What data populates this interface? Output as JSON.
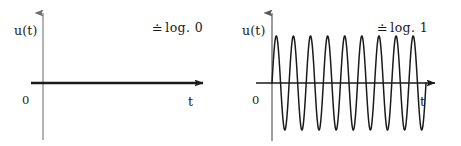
{
  "figure": {
    "background_color": "#ffffff",
    "axis_color_vertical_left": "#9a9a9a",
    "axis_color_vertical_right": "#7d7d7d",
    "axis_color_horizontal": "#1a1a1a",
    "curve_color": "#1a1a1a"
  },
  "panels": [
    {
      "id": "panel-left",
      "y_axis_label": "u(t)",
      "x_axis_label": "t",
      "origin_label": "0",
      "annotation_symbol": "≐",
      "annotation_text": "log. 0"
    },
    {
      "id": "panel-right",
      "y_axis_label": "u(t)",
      "x_axis_label": "t",
      "origin_label": "0",
      "annotation_symbol": "≐",
      "annotation_text": "log. 1"
    }
  ],
  "chart_data": [
    {
      "type": "line",
      "title": "",
      "subtitle": "",
      "annotation": "≐ log. 0",
      "xlabel": "t",
      "ylabel": "u(t)",
      "xlim": [
        0,
        10
      ],
      "ylim": [
        -1.15,
        1.15
      ],
      "grid": false,
      "legend": "none",
      "series": [
        {
          "name": "u(t) = 0",
          "waveform": "constant",
          "amplitude": 0,
          "frequency_cycles": 0,
          "values_description": "flat line at u = 0 for all t > 0",
          "x": [
            0,
            1,
            2,
            3,
            4,
            5,
            6,
            7,
            8,
            9,
            10
          ],
          "values": [
            0,
            0,
            0,
            0,
            0,
            0,
            0,
            0,
            0,
            0,
            0
          ]
        }
      ]
    },
    {
      "type": "line",
      "title": "",
      "subtitle": "",
      "annotation": "≐ log. 1",
      "xlabel": "t",
      "ylabel": "u(t)",
      "xlim": [
        0,
        10
      ],
      "ylim": [
        -1.15,
        1.15
      ],
      "grid": false,
      "legend": "none",
      "series": [
        {
          "name": "u(t) = A·sin(2πft)",
          "waveform": "sine",
          "amplitude": 1,
          "frequency_cycles": 9,
          "phase": 0,
          "values_description": "9 full sine cycles of unit amplitude over t = 0..9, then the signal stops",
          "x": [
            0,
            0.25,
            0.5,
            0.75,
            1,
            1.25,
            1.5,
            1.75,
            2,
            2.25,
            2.5,
            2.75,
            3,
            3.25,
            3.5,
            3.75,
            4,
            4.25,
            4.5,
            4.75,
            5,
            5.25,
            5.5,
            5.75,
            6,
            6.25,
            6.5,
            6.75,
            7,
            7.25,
            7.5,
            7.75,
            8,
            8.25,
            8.5,
            8.75,
            9
          ],
          "values": [
            0,
            1,
            0,
            -1,
            0,
            1,
            0,
            -1,
            0,
            1,
            0,
            -1,
            0,
            1,
            0,
            -1,
            0,
            1,
            0,
            -1,
            0,
            1,
            0,
            -1,
            0,
            1,
            0,
            -1,
            0,
            1,
            0,
            -1,
            0,
            1,
            0,
            -1,
            0
          ]
        }
      ]
    }
  ]
}
